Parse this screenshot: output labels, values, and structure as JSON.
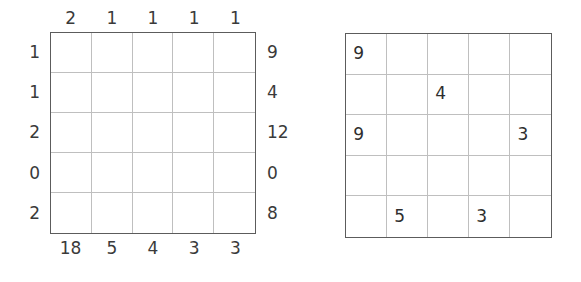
{
  "page": {
    "background_color": "#ffffff",
    "text_color": "#3a3a3a",
    "grid_border_color": "#5c5c5c",
    "grid_line_color": "#bfbfbf"
  },
  "left_puzzle": {
    "name": "clue-grid",
    "rows": 5,
    "columns": 5,
    "top_clues": [
      "2",
      "1",
      "1",
      "1",
      "1"
    ],
    "bottom_clues": [
      "18",
      "5",
      "4",
      "3",
      "3"
    ],
    "left_clues": [
      "1",
      "1",
      "2",
      "0",
      "2"
    ],
    "right_clues": [
      "9",
      "4",
      "12",
      "0",
      "8"
    ],
    "cells": [
      [
        "",
        "",
        "",
        "",
        ""
      ],
      [
        "",
        "",
        "",
        "",
        ""
      ],
      [
        "",
        "",
        "",
        "",
        ""
      ],
      [
        "",
        "",
        "",
        "",
        ""
      ],
      [
        "",
        "",
        "",
        "",
        ""
      ]
    ]
  },
  "right_puzzle": {
    "name": "answer-grid",
    "rows": 5,
    "columns": 5,
    "cells": [
      [
        "9",
        "",
        "",
        "",
        ""
      ],
      [
        "",
        "",
        "4",
        "",
        ""
      ],
      [
        "9",
        "",
        "",
        "",
        "3"
      ],
      [
        "",
        "",
        "",
        "",
        ""
      ],
      [
        "",
        "5",
        "",
        "3",
        ""
      ]
    ]
  }
}
